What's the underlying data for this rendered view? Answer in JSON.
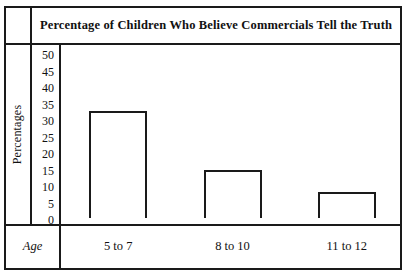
{
  "chart_data": {
    "type": "bar",
    "title": "Percentage of Children Who Believe Commercials Tell the Truth",
    "xlabel": "Age",
    "ylabel": "Percentages",
    "categories": [
      "5 to 7",
      "8 to 10",
      "11 to 12"
    ],
    "values": [
      32.5,
      14.5,
      8
    ],
    "ylim": [
      0,
      50
    ],
    "yticks": [
      50,
      45,
      40,
      35,
      30,
      25,
      20,
      15,
      10,
      5,
      0
    ],
    "ytick_labels": [
      "50",
      "45",
      "40",
      "35",
      "30",
      "25",
      "20",
      "15",
      "10",
      "5",
      "0"
    ],
    "grid": false,
    "legend": false,
    "bar_fill_color": "#ffffff",
    "bar_edge_color": "#1a1a1a",
    "frame_color": "#1a1a1a",
    "background_color": "#ffffff"
  }
}
